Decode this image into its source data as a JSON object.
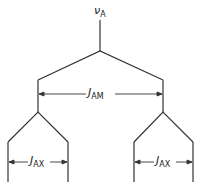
{
  "diagram": {
    "type": "nmr-splitting-tree",
    "root_label": {
      "symbol": "ν",
      "subscript": "A"
    },
    "level1_coupling": {
      "symbol": "J",
      "subscript": "AM"
    },
    "level2_coupling_left": {
      "symbol": "J",
      "subscript": "AX"
    },
    "level2_coupling_right": {
      "symbol": "J",
      "subscript": "AX"
    },
    "line_color": "#333333"
  }
}
